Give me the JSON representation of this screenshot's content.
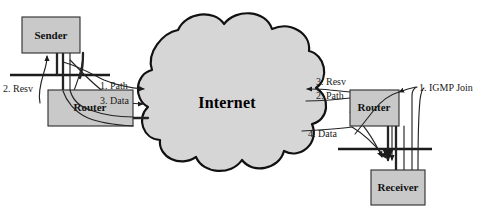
{
  "diagram": {
    "background_color": "#ffffff",
    "node_fill_color": "#c9c9c9",
    "cloud_fill_color": "#d6d6d6",
    "line_color": "#1b1b1b",
    "nodes": [
      {
        "id": "sender",
        "label": "Sender",
        "x": 22,
        "y": 17,
        "w": 58,
        "h": 36
      },
      {
        "id": "router-l",
        "label": "Router",
        "x": 48,
        "y": 90,
        "w": 85,
        "h": 36
      },
      {
        "id": "router-r",
        "label": "Router",
        "x": 350,
        "y": 90,
        "w": 49,
        "h": 36
      },
      {
        "id": "receiver",
        "label": "Receiver",
        "x": 371,
        "y": 170,
        "w": 54,
        "h": 35
      }
    ],
    "cloud": {
      "id": "internet-cloud",
      "label": "Internet",
      "label_x": 227,
      "label_y": 104
    },
    "lan_segments": [
      {
        "id": "lan-left",
        "x1": 10,
        "y1": 75,
        "x2": 110,
        "y2": 75
      },
      {
        "id": "lan-right",
        "x1": 338,
        "y1": 149,
        "x2": 432,
        "y2": 149
      }
    ],
    "flows": [
      {
        "id": "flow-resv-left",
        "label": "2. Resv",
        "label_x": 3,
        "label_y": 90,
        "direction": "toward-sender"
      },
      {
        "id": "flow-path-left",
        "label": "1. Path",
        "label_x": 100,
        "label_y": 87,
        "direction": "toward-internet"
      },
      {
        "id": "flow-data-left",
        "label": "3. Data",
        "label_x": 100,
        "label_y": 102,
        "direction": "toward-internet"
      },
      {
        "id": "flow-resv-right",
        "label": "3. Resv",
        "label_x": 316,
        "label_y": 83,
        "direction": "toward-internet"
      },
      {
        "id": "flow-path-right",
        "label": "2. Path",
        "label_x": 316,
        "label_y": 97,
        "direction": "toward-router"
      },
      {
        "id": "flow-data-right",
        "label": "4. Data",
        "label_x": 308,
        "label_y": 135,
        "direction": "toward-receiver"
      },
      {
        "id": "flow-igmp-join",
        "label": "1. IGMP Join",
        "label_x": 419,
        "label_y": 89,
        "direction": "toward-router"
      }
    ]
  }
}
